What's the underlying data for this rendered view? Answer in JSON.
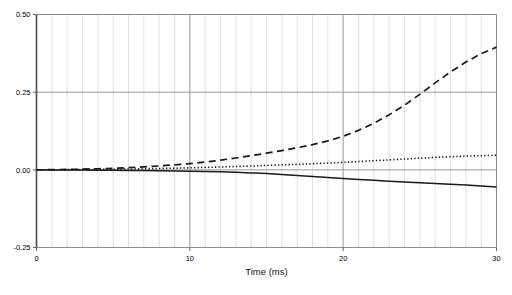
{
  "chart_data": {
    "type": "line",
    "title": "",
    "xlabel": "Time (ms)",
    "ylabel": "",
    "xlim": [
      0,
      30
    ],
    "ylim": [
      -0.25,
      0.5
    ],
    "xticks": [
      0,
      10,
      20,
      30
    ],
    "xtick_labels": [
      "0",
      "10",
      "20",
      "30"
    ],
    "yticks": [
      -0.25,
      0.0,
      0.25,
      0.5
    ],
    "ytick_labels": [
      "-0.25",
      "0.00",
      "0.25",
      "0.50"
    ],
    "grid": {
      "vertical_minor_step": 1,
      "vertical_major": [
        10,
        20
      ],
      "horizontal_major": [
        0.0,
        0.25
      ],
      "minor_color": "#dddddd",
      "major_color": "#999999"
    },
    "legend": {
      "visible": false,
      "position": "none"
    },
    "x": [
      0,
      1,
      2,
      3,
      4,
      5,
      6,
      7,
      8,
      9,
      10,
      11,
      12,
      13,
      14,
      15,
      16,
      17,
      18,
      19,
      20,
      21,
      22,
      23,
      24,
      25,
      26,
      27,
      28,
      29,
      30
    ],
    "series": [
      {
        "name": "dashed-curve",
        "style": "dashed",
        "color": "#1a1a1a",
        "values": [
          0.0,
          0.0005,
          0.0012,
          0.0022,
          0.0035,
          0.0052,
          0.0072,
          0.0096,
          0.0125,
          0.016,
          0.02,
          0.025,
          0.031,
          0.038,
          0.0455,
          0.0535,
          0.062,
          0.071,
          0.081,
          0.093,
          0.108,
          0.127,
          0.15,
          0.177,
          0.208,
          0.243,
          0.28,
          0.315,
          0.347,
          0.374,
          0.395
        ]
      },
      {
        "name": "dotted-curve",
        "style": "dotted",
        "color": "#1a1a1a",
        "values": [
          0.0,
          0.0002,
          0.0005,
          0.0009,
          0.0014,
          0.002,
          0.0027,
          0.0035,
          0.0044,
          0.0054,
          0.0065,
          0.0078,
          0.0092,
          0.0107,
          0.0123,
          0.014,
          0.0158,
          0.0177,
          0.0197,
          0.0218,
          0.024,
          0.0265,
          0.0292,
          0.032,
          0.0348,
          0.0375,
          0.04,
          0.0422,
          0.044,
          0.0455,
          0.0468
        ]
      },
      {
        "name": "solid-curve",
        "style": "solid",
        "color": "#1a1a1a",
        "values": [
          0.0,
          -0.0002,
          -0.0004,
          -0.0007,
          -0.001,
          -0.0014,
          -0.0019,
          -0.0024,
          -0.003,
          -0.0036,
          -0.0043,
          -0.0052,
          -0.0063,
          -0.0078,
          -0.0098,
          -0.0122,
          -0.015,
          -0.0182,
          -0.0215,
          -0.0248,
          -0.028,
          -0.031,
          -0.0338,
          -0.0365,
          -0.039,
          -0.0415,
          -0.044,
          -0.0465,
          -0.0492,
          -0.052,
          -0.055
        ]
      }
    ]
  },
  "axes": {
    "x_axis_title": "Time (ms)"
  }
}
